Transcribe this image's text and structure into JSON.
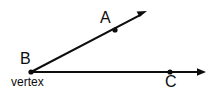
{
  "figure": {
    "type": "geometry-angle-diagram",
    "background_color": "#ffffff",
    "stroke_color": "#0d0d0d",
    "width": 212,
    "height": 97,
    "labels": {
      "point_a": "A",
      "point_b": "B",
      "point_c": "C",
      "vertex_caption": "vertex"
    },
    "points": [
      {
        "name": "B",
        "role": "vertex",
        "x": 31,
        "y": 72
      },
      {
        "name": "A",
        "role": "ray-point",
        "x": 115,
        "y": 30
      },
      {
        "name": "C",
        "role": "ray-point",
        "x": 170,
        "y": 72
      }
    ],
    "rays": [
      {
        "name": "ray-BA",
        "from": "B",
        "through": "A",
        "start": {
          "x": 31,
          "y": 72
        },
        "end": {
          "x": 146,
          "y": 12
        },
        "arrow_at_end": true
      },
      {
        "name": "ray-BC",
        "from": "B",
        "through": "C",
        "start": {
          "x": 31,
          "y": 72
        },
        "end": {
          "x": 205,
          "y": 72
        },
        "arrow_at_end": true
      }
    ]
  }
}
